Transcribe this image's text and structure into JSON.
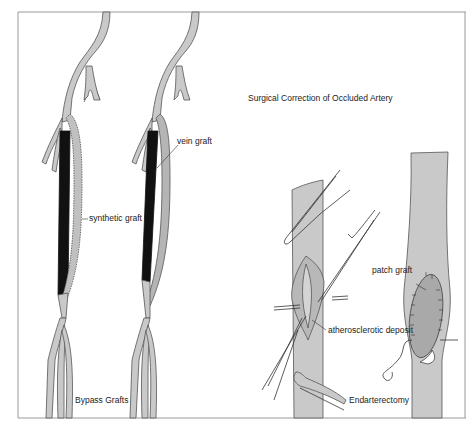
{
  "figure": {
    "title": "Surgical Correction of Occluded Artery",
    "colors": {
      "vessel_fill": "#c9c9c9",
      "vessel_outline": "#555555",
      "occlusion": "#111111",
      "patch_fill": "#a9a9a9",
      "frame": "#9a9a9a",
      "background": "#ffffff"
    },
    "panels": [
      {
        "name": "Bypass Grafts",
        "caption": "Bypass Grafts",
        "labels": [
          {
            "text": "synthetic graft"
          },
          {
            "text": "vein graft"
          }
        ]
      },
      {
        "name": "Endarterectomy",
        "caption": "Endarterectomy",
        "labels": [
          {
            "text": "atherosclerotic deposit"
          }
        ]
      },
      {
        "name": "Patch Graft",
        "labels": [
          {
            "text": "patch graft"
          }
        ]
      }
    ]
  }
}
